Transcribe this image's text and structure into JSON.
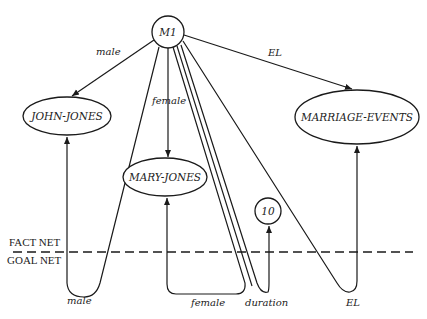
{
  "nodes": {
    "m1": {
      "label": "M1"
    },
    "john_jones": {
      "label": "JOHN-JONES"
    },
    "mary_jones": {
      "label": "MARY-JONES"
    },
    "marriage_events": {
      "label": "MARRIAGE-EVENTS"
    },
    "ten": {
      "label": "10"
    }
  },
  "fact_edges": {
    "male": {
      "label": "male"
    },
    "female": {
      "label": "female"
    },
    "el": {
      "label": "EL"
    }
  },
  "goal_edges": {
    "male": {
      "label": "male"
    },
    "female": {
      "label": "female"
    },
    "duration": {
      "label": "duration"
    },
    "el": {
      "label": "EL"
    }
  },
  "separator": {
    "upper_label": "FACT NET",
    "lower_label": "GOAL NET"
  }
}
